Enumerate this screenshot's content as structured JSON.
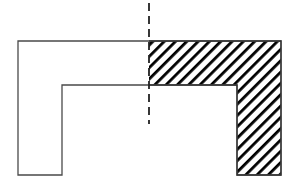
{
  "diagram": {
    "type": "geometric-figure",
    "colors": {
      "background": "#ffffff",
      "outline": "#4a4a4a",
      "hatch": "#000000",
      "axis": "#222222"
    },
    "shape": {
      "outer_left": 18,
      "outer_right": 281,
      "top": 41,
      "bottom": 175,
      "inner_left": 62,
      "inner_right": 237,
      "inner_top": 85
    },
    "axis": {
      "x": 149,
      "y_start": 3,
      "y_end": 124,
      "dash": 8,
      "gap": 5
    },
    "hatch": {
      "direction": "diagonal-descending",
      "spacing": 8,
      "stroke_width": 2.6,
      "region": "right-half"
    }
  }
}
